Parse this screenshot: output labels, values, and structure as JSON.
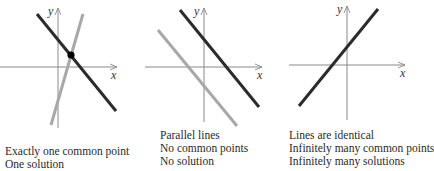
{
  "colors": {
    "axis": "#8a8a8a",
    "dark_line": "#2b2b2b",
    "light_line": "#a8a8a8",
    "point": "#000000",
    "text": "#2a2a2a"
  },
  "panels": [
    {
      "id": "one-solution",
      "axis_labels": {
        "x": "x",
        "y": "y"
      },
      "caption": [
        "Exactly one common point",
        "One solution"
      ]
    },
    {
      "id": "no-solution",
      "axis_labels": {
        "x": "x",
        "y": "y"
      },
      "caption": [
        "Parallel lines",
        "No common points",
        "No solution"
      ]
    },
    {
      "id": "infinite-solutions",
      "axis_labels": {
        "x": "x",
        "y": "y"
      },
      "caption": [
        "Lines are identical",
        "Infinitely many common points",
        "Infinitely many solutions"
      ]
    }
  ]
}
